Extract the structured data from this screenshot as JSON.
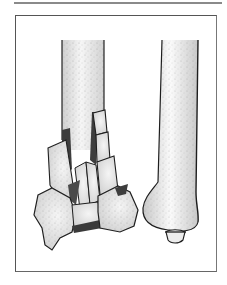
{
  "figure": {
    "left_bone": {
      "label": "fractured-bone",
      "state": "comminuted fracture"
    },
    "right_bone": {
      "label": "normal-bone",
      "state": "intact"
    },
    "caption": ""
  },
  "colors": {
    "background": "#ffffff",
    "frame": "#555555",
    "top_rule": "#8a8a8a",
    "bone_fill": "#e6e6e6",
    "bone_highlight": "#f8f8f8",
    "bone_outline": "#1e1e1e",
    "fracture_shadow": "#444444"
  }
}
